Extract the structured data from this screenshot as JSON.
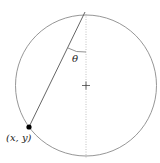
{
  "diagram": {
    "circle": {
      "cx": 86,
      "cy": 85.5,
      "r": 70.5,
      "stroke": "#8a8a8a"
    },
    "top_point": {
      "x": 85,
      "y": 12
    },
    "point": {
      "x": 29,
      "y": 127,
      "label": "(x, y)"
    },
    "angle_label": "θ",
    "center_marker": "+",
    "vertical_axis": {
      "style": "dotted",
      "color": "#b0b0b0"
    }
  }
}
